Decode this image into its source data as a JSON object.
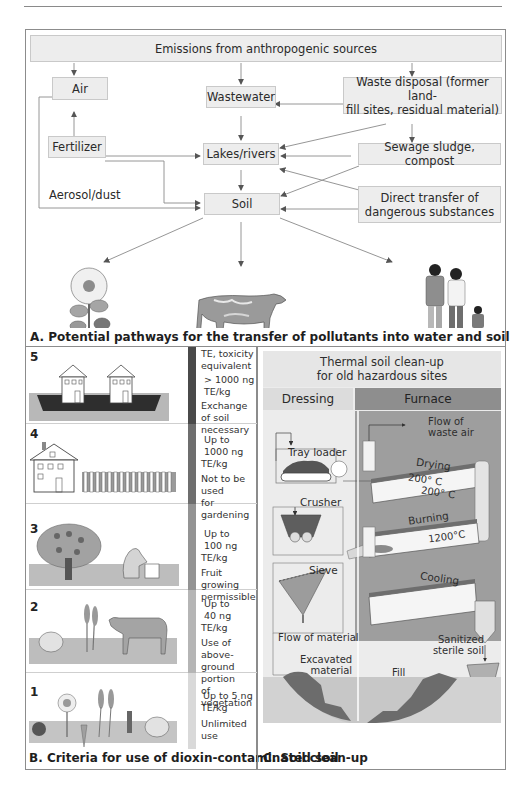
{
  "page": {
    "page_number": "97"
  },
  "panel_a": {
    "caption": "A. Potential pathways for the transfer of pollutants into water and soil",
    "nodes": {
      "emissions": "Emissions from anthropogenic sources",
      "air": "Air",
      "wastewater": "Wastewater",
      "waste_disposal_line1": "Waste disposal (former land-",
      "waste_disposal_line2": "fill sites, residual material)",
      "fertilizer": "Fertilizer",
      "lakes_rivers": "Lakes/rivers",
      "sewage_sludge": "Sewage sludge, compost",
      "soil": "Soil",
      "direct_transfer_line1": "Direct transfer of",
      "direct_transfer_line2": "dangerous substances"
    },
    "labels": {
      "aerosol": "Aerosol/dust",
      "plants": "Plants",
      "animals": "Animals",
      "humans": "Humans"
    },
    "colors": {
      "box_fill": "#ededed",
      "box_border": "#c9c9c9",
      "arrow": "#6a6a6a"
    }
  },
  "panel_b": {
    "caption": "B. Criteria for use of dioxin-contaminated soil",
    "levels": [
      {
        "level": "5",
        "head1": "TE, toxicity",
        "head2": "equivalent",
        "value": "> 1000 ng TE/kg",
        "use1": "Exchange of soil",
        "use2": "necessary",
        "bar_color": "#4a4a4a"
      },
      {
        "level": "4",
        "head1": "",
        "head2": "",
        "value1": "Up to",
        "value2": "1000 ng TE/kg",
        "use1": "Not to be used",
        "use2": "for gardening",
        "bar_color": "#6e6e6e"
      },
      {
        "level": "3",
        "value1": "Up to",
        "value2": "100 ng TE/kg",
        "use1": "Fruit growing",
        "use2": "permissible",
        "bar_color": "#939393"
      },
      {
        "level": "2",
        "value1": "Up to",
        "value2": "40 ng TE/kg",
        "use1": "Use of above-",
        "use2": "ground portion",
        "use3": "of vegetation",
        "bar_color": "#b5b5b5"
      },
      {
        "level": "1",
        "value": "Up to 5 ng TE/kg",
        "use1": "Unlimited use",
        "bar_color": "#d9d9d9"
      }
    ]
  },
  "panel_c": {
    "caption": "C. Soil clean-up",
    "title1": "Thermal soil clean-up",
    "title2": "for old hazardous sites",
    "col_dressing": "Dressing",
    "col_furnace": "Furnace",
    "labels": {
      "tray_loader": "Tray loader",
      "crusher": "Crusher",
      "sieve": "Sieve",
      "flow_material": "Flow of material",
      "excavated1": "Excavated",
      "excavated2": "material",
      "flow_waste_air1": "Flow of",
      "flow_waste_air2": "waste air",
      "drying": "Drying",
      "temp_drying_1": "200° C",
      "temp_drying_2": "200° C",
      "burning": "Burning",
      "temp_burning": "1200°C",
      "cooling": "Cooling",
      "sanitized1": "Sanitized",
      "sanitized2": "sterile soil",
      "fill": "Fill"
    },
    "colors": {
      "dressing_bg": "#ececec",
      "furnace_bg": "#9e9e9e",
      "header_bg": "#e6e6e6"
    }
  }
}
